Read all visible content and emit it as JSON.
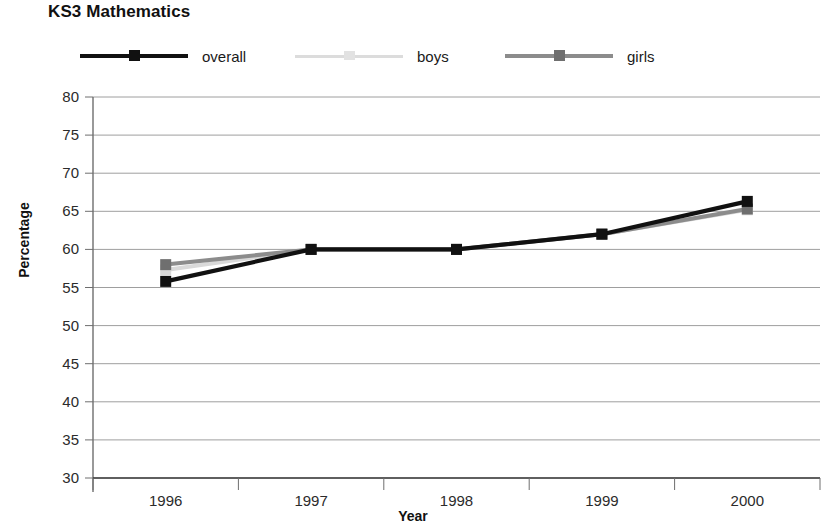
{
  "chart_data": {
    "type": "line",
    "title": "KS3 Mathematics",
    "xlabel": "Year",
    "ylabel": "Percentage",
    "categories": [
      "1996",
      "1997",
      "1998",
      "1999",
      "2000"
    ],
    "x": [
      1996,
      1997,
      1998,
      1999,
      2000
    ],
    "series": [
      {
        "name": "overall",
        "values": [
          55.8,
          60.0,
          60.0,
          62.0,
          66.3
        ],
        "color": "#111111"
      },
      {
        "name": "boys",
        "values": [
          57.3,
          60.0,
          60.0,
          62.0,
          65.2
        ],
        "color": "#d9d9d9"
      },
      {
        "name": "girls",
        "values": [
          58.0,
          60.0,
          60.0,
          62.0,
          65.3
        ],
        "color": "#8c8c8c"
      }
    ],
    "ylim": [
      30,
      80
    ],
    "yticks": [
      30,
      35,
      40,
      45,
      50,
      55,
      60,
      65,
      70,
      75,
      80
    ],
    "ytick_labels": [
      "30",
      "35",
      "40",
      "45",
      "50",
      "55",
      "60",
      "65",
      "70",
      "75",
      "80"
    ],
    "grid": true,
    "grid_axis": "y",
    "legend_position": "top",
    "axis_color": "#808080",
    "grid_color": "#9e9e9e"
  },
  "legend": {
    "entries": [
      {
        "label": "overall"
      },
      {
        "label": "boys"
      },
      {
        "label": "girls"
      }
    ]
  }
}
